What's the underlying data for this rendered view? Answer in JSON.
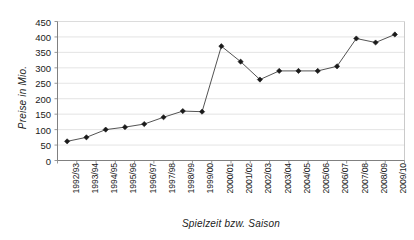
{
  "chart_data": {
    "type": "line",
    "title": "",
    "xlabel": "Spielzeit bzw. Saison",
    "ylabel": "Preise in Mio.",
    "categories": [
      "1992/93",
      "1993/94",
      "1994/95",
      "1995/96",
      "1996/97",
      "1997/98",
      "1998/99",
      "1999/00",
      "2000/01",
      "2001/02",
      "2002/03",
      "2003/04",
      "2004/05",
      "2005/06",
      "2006/07",
      "2007/08",
      "2008/09",
      "2009/10"
    ],
    "values": [
      62,
      75,
      100,
      108,
      118,
      140,
      160,
      158,
      370,
      320,
      262,
      290,
      290,
      290,
      305,
      395,
      382,
      408
    ],
    "series": [
      {
        "name": "Preise",
        "values": [
          62,
          75,
          100,
          108,
          118,
          140,
          160,
          158,
          370,
          320,
          262,
          290,
          290,
          290,
          305,
          395,
          382,
          408
        ]
      }
    ],
    "ylim": [
      0,
      450
    ],
    "ytick_labels": [
      "0",
      "50",
      "100",
      "150",
      "200",
      "250",
      "300",
      "350",
      "400",
      "450"
    ],
    "ytick_values": [
      0,
      50,
      100,
      150,
      200,
      250,
      300,
      350,
      400,
      450
    ],
    "grid": true,
    "legend": false,
    "legend_position": "none",
    "line_color": "#404040",
    "marker_color": "#1a1a1a",
    "marker": "diamond",
    "grid_color": "#d9d9d9",
    "axis_color": "#808080"
  }
}
